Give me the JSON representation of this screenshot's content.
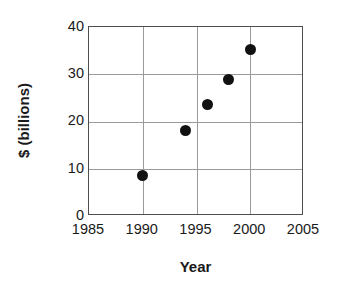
{
  "chart_data": {
    "type": "scatter",
    "title": "",
    "xlabel": "Year",
    "ylabel": "$ (billions)",
    "xlim": [
      1985,
      2005
    ],
    "ylim": [
      0,
      40
    ],
    "grid": true,
    "legend": false,
    "xticks": [
      "1985",
      "1990",
      "1995",
      "2000",
      "2005"
    ],
    "xtick_values": [
      1985,
      1990,
      1995,
      2000,
      2005
    ],
    "yticks": [
      "0",
      "10",
      "20",
      "30",
      "40"
    ],
    "ytick_values": [
      0,
      10,
      20,
      30,
      40
    ],
    "x": [
      1990,
      1994,
      1996,
      1998,
      2000
    ],
    "y": [
      8.5,
      18,
      23.5,
      28.8,
      35.3
    ],
    "series": [
      {
        "name": "",
        "marker": "filled-circle",
        "color": "#111111",
        "points": [
          {
            "x": 1990,
            "y": 8.5
          },
          {
            "x": 1994,
            "y": 18
          },
          {
            "x": 1996,
            "y": 23.5
          },
          {
            "x": 1998,
            "y": 28.8
          },
          {
            "x": 2000,
            "y": 35.3
          }
        ]
      }
    ]
  },
  "style": {
    "marker_color": "#111111",
    "grid_color": "#9a9a9a",
    "frame_color": "#4d4d4d",
    "text_color": "#1a1a1a",
    "background": "#ffffff"
  }
}
